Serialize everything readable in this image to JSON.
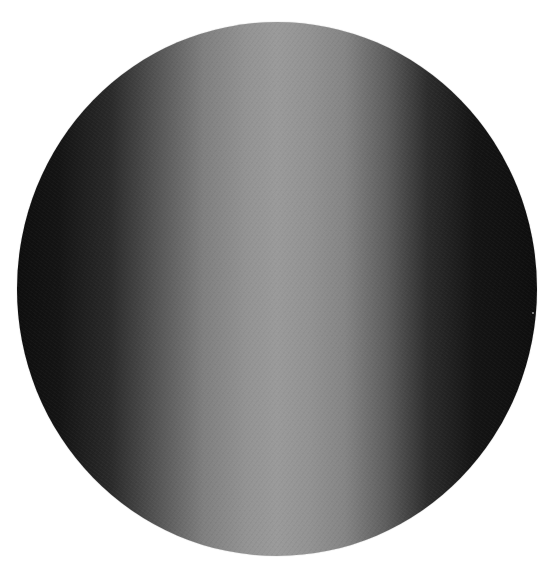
{
  "caption": {
    "text": "Figure: a partially visible caption cropped at the top edge",
    "visible": "clipped"
  },
  "image": {
    "subject": "grayscale sphere / disc with horizontal shading",
    "colors": {
      "background": "#ffffff",
      "edge_dark": "#0e0e0e",
      "center_light": "#9a9a9a"
    },
    "bounds": {
      "left": 17,
      "top": 22,
      "width": 520,
      "height": 534
    }
  }
}
